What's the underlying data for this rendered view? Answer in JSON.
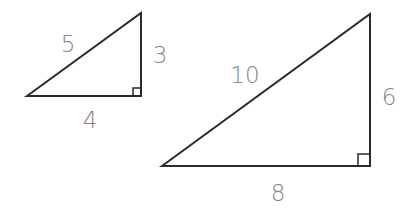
{
  "diagram": {
    "type": "similar-right-triangles",
    "small_triangle": {
      "hypotenuse_label": "5",
      "vertical_leg_label": "3",
      "horizontal_leg_label": "4",
      "right_angle_marker": true
    },
    "large_triangle": {
      "hypotenuse_label": "10",
      "vertical_leg_label": "6",
      "horizontal_leg_label": "8",
      "right_angle_marker": true
    },
    "colors": {
      "stroke": "#2a2a2a",
      "label": "#858585",
      "background": "#ffffff"
    }
  }
}
